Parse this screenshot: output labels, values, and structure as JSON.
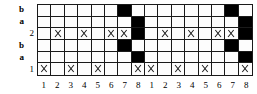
{
  "figure": {
    "type": "lattice-grid-diagram",
    "columns": 16,
    "rows": 6,
    "colors": {
      "filled": "#000000",
      "empty": "#fdfdfd",
      "line": "#1a1a1a",
      "background": "#ffffff"
    }
  },
  "row_labels": [
    {
      "text": "b",
      "kind": "letter"
    },
    {
      "text": "a",
      "kind": "letter"
    },
    {
      "text": "2",
      "kind": "num"
    },
    {
      "text": "b",
      "kind": "letter"
    },
    {
      "text": "a",
      "kind": "letter"
    },
    {
      "text": "1",
      "kind": "num"
    }
  ],
  "col_labels": [
    "1",
    "2",
    "3",
    "4",
    "5",
    "6",
    "7",
    "8",
    "1",
    "2",
    "3",
    "4",
    "5",
    "6",
    "7",
    "8"
  ],
  "chart_data": {
    "type": "heatmap",
    "title": "",
    "xlabel": "",
    "ylabel": "",
    "categories": [
      "1",
      "2",
      "3",
      "4",
      "5",
      "6",
      "7",
      "8",
      "1",
      "2",
      "3",
      "4",
      "5",
      "6",
      "7",
      "8"
    ],
    "row_names": [
      "b",
      "a",
      "2",
      "b",
      "a",
      "1"
    ],
    "legend": [
      {
        "marker": "filled",
        "label": "black square"
      },
      {
        "marker": "x",
        "label": "cross mark"
      },
      {
        "marker": "empty",
        "label": "empty cell"
      }
    ],
    "cells": [
      [
        "empty",
        "empty",
        "empty",
        "empty",
        "empty",
        "empty",
        "filled",
        "empty",
        "empty",
        "empty",
        "empty",
        "empty",
        "empty",
        "empty",
        "filled",
        "empty"
      ],
      [
        "empty",
        "empty",
        "empty",
        "empty",
        "empty",
        "empty",
        "empty",
        "filled",
        "empty",
        "empty",
        "empty",
        "empty",
        "empty",
        "empty",
        "empty",
        "filled"
      ],
      [
        "empty",
        "x",
        "empty",
        "x",
        "empty",
        "x",
        "x",
        "filled",
        "empty",
        "x",
        "empty",
        "x",
        "empty",
        "x",
        "x",
        "filled"
      ],
      [
        "empty",
        "empty",
        "empty",
        "empty",
        "empty",
        "empty",
        "filled",
        "empty",
        "empty",
        "empty",
        "empty",
        "empty",
        "empty",
        "empty",
        "filled",
        "empty"
      ],
      [
        "empty",
        "empty",
        "empty",
        "empty",
        "empty",
        "empty",
        "empty",
        "filled",
        "empty",
        "empty",
        "empty",
        "empty",
        "empty",
        "empty",
        "empty",
        "filled"
      ],
      [
        "x",
        "empty",
        "x",
        "empty",
        "x",
        "empty",
        "empty",
        "x",
        "x",
        "empty",
        "x",
        "empty",
        "x",
        "empty",
        "empty",
        "x"
      ]
    ]
  }
}
